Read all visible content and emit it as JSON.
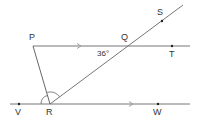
{
  "diagram": {
    "type": "geometry",
    "colors": {
      "line": "#555555",
      "text": "#333333",
      "arrow": "#999999"
    },
    "points": [
      {
        "name": "P",
        "label": "P",
        "x": 33,
        "y": 46
      },
      {
        "name": "Q",
        "label": "Q",
        "x": 128,
        "y": 46
      },
      {
        "name": "S",
        "label": "S",
        "x": 162,
        "y": 21
      },
      {
        "name": "T",
        "label": "T",
        "x": 172,
        "y": 46
      },
      {
        "name": "R",
        "label": "R",
        "x": 50,
        "y": 104
      },
      {
        "name": "V",
        "label": "V",
        "x": 19,
        "y": 104
      },
      {
        "name": "W",
        "label": "W",
        "x": 158,
        "y": 104
      }
    ],
    "angle_label": "36°",
    "parallel_lines": [
      "PT",
      "VW"
    ],
    "segments": [
      "PT",
      "VW",
      "PR",
      "RS"
    ]
  }
}
